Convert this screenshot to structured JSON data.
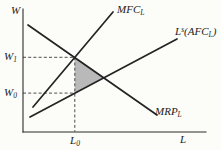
{
  "figure": {
    "axes": {
      "y_label": "W",
      "x_label": "L"
    },
    "curves": {
      "mfc": {
        "name": "MFC",
        "sub": "L"
      },
      "supply": {
        "l": "L",
        "sup": "s",
        "mid": "(AFC",
        "sub": "L",
        "end": ")"
      },
      "mrp": {
        "name": "MRP",
        "sub": "L"
      }
    },
    "markers": {
      "w1": {
        "main": "W",
        "sub": "1"
      },
      "w0": {
        "main": "W",
        "sub": "0"
      },
      "l0": {
        "main": "L",
        "sub": "0"
      }
    },
    "colors": {
      "line": "#232323",
      "axis": "#2b2b2b",
      "dashed": "#3a3a3a",
      "shaded_region": "#b9b9b9",
      "background": "#fcfcf9"
    }
  }
}
